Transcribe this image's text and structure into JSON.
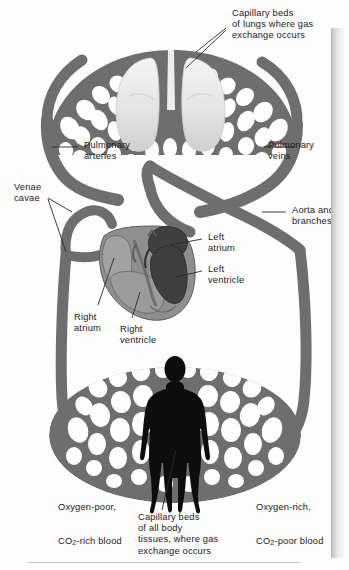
{
  "figure": {
    "colors": {
      "vessel_gray": "#6e6e6e",
      "vessel_gray_dark": "#5a5a5a",
      "heart_light": "#8f8f8f",
      "heart_dark": "#4a4a4a",
      "lung_light": "#e9e9e9",
      "body_silhouette": "#0d0d0d",
      "leader_line": "#2a2a2a",
      "text": "#1b1b1b",
      "background": "#fdfdfd"
    }
  },
  "labels": {
    "lung_capillaries": {
      "lines": [
        "Capillary beds",
        "of lungs where gas",
        "exchange occurs"
      ],
      "text": "Capillary beds\nof lungs where gas\nexchange occurs"
    },
    "pulmonary_arteries": {
      "lines": [
        "Pulmonary",
        "arteries"
      ],
      "text": "Pulmonary\narteries"
    },
    "pulmonary_veins": {
      "lines": [
        "Pulmonary",
        "veins"
      ],
      "text": "Pulmonary\nveins"
    },
    "venae_cavae": {
      "lines": [
        "Venae",
        "cavae"
      ],
      "text": "Venae\ncavae"
    },
    "aorta_and_branches": {
      "lines": [
        "Aorta and",
        "branches"
      ],
      "text": "Aorta and\nbranches"
    },
    "left_atrium": {
      "lines": [
        "Left",
        "atrium"
      ],
      "text": "Left\natrium"
    },
    "left_ventricle": {
      "lines": [
        "Left",
        "ventricle"
      ],
      "text": "Left\nventricle"
    },
    "right_atrium": {
      "lines": [
        "Right",
        "atrium"
      ],
      "text": "Right\natrium"
    },
    "right_ventricle": {
      "lines": [
        "Right",
        "ventricle"
      ],
      "text": "Right\nventricle"
    },
    "oxygen_poor": {
      "line1": "Oxygen-poor,",
      "line2_pre": "CO",
      "line2_sub": "2",
      "line2_post": "-rich blood"
    },
    "oxygen_rich": {
      "line1": "Oxygen-rich,",
      "line2_pre": "CO",
      "line2_sub": "2",
      "line2_post": "-poor blood"
    },
    "body_capillaries": {
      "lines": [
        "Capillary beds",
        "of all body",
        "tissues, where gas",
        "exchange occurs"
      ],
      "text": "Capillary beds\nof all body\ntissues, where gas\nexchange occurs"
    }
  }
}
